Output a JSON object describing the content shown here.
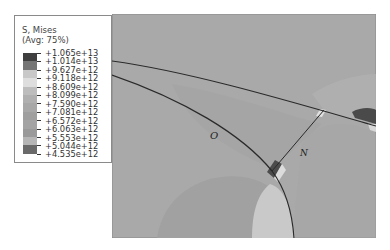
{
  "legend": {
    "title_line1": "S, Mises",
    "title_line2": "(Avg: 75%)",
    "values": [
      "+1.065e+13",
      "+1.014e+13",
      "+9.627e+12",
      "+9.118e+12",
      "+8.609e+12",
      "+8.099e+12",
      "+7.590e+12",
      "+7.081e+12",
      "+6.572e+12",
      "+6.063e+12",
      "+5.553e+12",
      "+5.044e+12",
      "+4.535e+12"
    ],
    "colors": [
      "#3f3f3f",
      "#757575",
      "#c8c8c8",
      "#dedede",
      "#bdbdbd",
      "#b0b0b0",
      "#a8a8a8",
      "#9f9f9f",
      "#a4a4a4",
      "#9a9a9a",
      "#b6b6b6",
      "#6a6a6a",
      "#363636"
    ]
  },
  "plot": {
    "background": "#a9a9a9",
    "labels": {
      "O": "O",
      "N": "N"
    }
  }
}
